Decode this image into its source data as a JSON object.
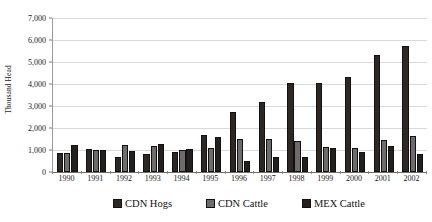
{
  "chart_data": {
    "type": "bar",
    "title": "",
    "subtitle": "",
    "xlabel": "",
    "ylabel": "Thousand Head",
    "ylim": [
      0,
      7000
    ],
    "ytick_values": [
      0,
      1000,
      2000,
      3000,
      4000,
      5000,
      6000,
      7000
    ],
    "ytick_labels": [
      "0",
      "1,000",
      "2,000",
      "3,000",
      "4,000",
      "5,000",
      "6,000",
      "7,000"
    ],
    "grid": true,
    "legend_position": "bottom",
    "categories": [
      "1990",
      "1991",
      "1992",
      "1993",
      "1994",
      "1995",
      "1996",
      "1997",
      "1998",
      "1999",
      "2000",
      "2001",
      "2002"
    ],
    "series": [
      {
        "name": "CDN Hogs",
        "color": "#2f2723",
        "values": [
          880,
          1030,
          680,
          830,
          900,
          1700,
          2750,
          3170,
          4060,
          4060,
          4320,
          5300,
          5720
        ]
      },
      {
        "name": "CDN Cattle",
        "color": "#6d6c6a",
        "values": [
          850,
          1000,
          1240,
          1160,
          1000,
          1100,
          1520,
          1480,
          1420,
          1120,
          1110,
          1440,
          1640
        ]
      },
      {
        "name": "MEX Cattle",
        "color": "#241f1c",
        "values": [
          1240,
          1010,
          950,
          1270,
          1050,
          1610,
          480,
          690,
          660,
          1080,
          910,
          1170,
          810
        ]
      }
    ]
  },
  "legend": {
    "items": [
      {
        "label": "CDN Hogs",
        "swatch": "legend-swatch-cdn-hogs"
      },
      {
        "label": "CDN Cattle",
        "swatch": "legend-swatch-cdn-cattle"
      },
      {
        "label": "MEX Cattle",
        "swatch": "legend-swatch-mex-cattle"
      }
    ]
  }
}
